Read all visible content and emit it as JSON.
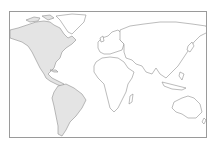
{
  "map": {
    "type": "world-outline",
    "projection": "equirectangular-like",
    "highlighted_region": "Americas",
    "colors": {
      "background": "#ffffff",
      "frame": "#9a9a9a",
      "outline": "#8f8f8f",
      "highlight_fill": "#e4e4e4",
      "land_fill": "#ffffff"
    },
    "regions": [
      {
        "name": "North America",
        "highlighted": true
      },
      {
        "name": "Greenland",
        "highlighted": false
      },
      {
        "name": "South America",
        "highlighted": true
      },
      {
        "name": "Europe",
        "highlighted": false
      },
      {
        "name": "Africa",
        "highlighted": false
      },
      {
        "name": "Asia",
        "highlighted": false
      },
      {
        "name": "Australia",
        "highlighted": false
      },
      {
        "name": "Madagascar",
        "highlighted": false
      }
    ]
  }
}
